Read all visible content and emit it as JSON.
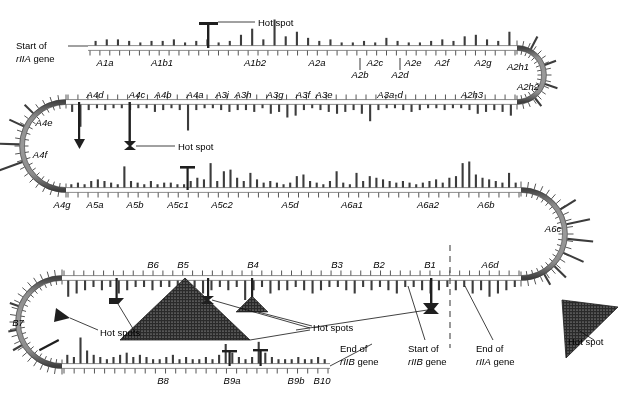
{
  "figure": {
    "type": "serpentine-mutation-map",
    "colors": {
      "line": "#7a7a7a",
      "line_edge": "#3a3a3a",
      "bar": "#3c3c3c",
      "tick": "#555555",
      "hotspot_fill": "#222222",
      "text": "#000000",
      "leader": "#000000",
      "dashed": "#555555"
    }
  },
  "annotations": {
    "start_rIIA": {
      "line1": "Start of",
      "line2_italic": "rIIA",
      "line2_rest": " gene"
    },
    "hot_spot_top": "Hot spot",
    "hot_spot_row2": "Hot spot",
    "hot_spots_b7": "Hot spots",
    "hot_spots_b5b4": "Hot spots",
    "hot_spots_b1": "Hot spots",
    "hot_spot_right": "Hot spot",
    "end_rIIB": {
      "line1": "End of",
      "line2_italic": "rIIB",
      "line2_rest": " gene"
    },
    "start_rIIB": {
      "line1": "Start of",
      "line2_italic": "rIIB",
      "line2_rest": " gene"
    },
    "end_rIIA": {
      "line1": "End of",
      "line2_italic": "rIIA",
      "line2_rest": " gene"
    }
  },
  "chart_data": {
    "type": "bar",
    "xlabel": "map position (segments)",
    "ylabel": "number of independent mutations",
    "rows": [
      {
        "row_id": "row1-top",
        "direction": "bars-up",
        "segment_labels": [
          "A1a",
          "A1b1",
          "A1b2",
          "A2a",
          "A2b",
          "A2c",
          "A2d",
          "A2e",
          "A2f",
          "A2g",
          "A2h1",
          "A2h2"
        ],
        "bar_values": [
          3,
          4,
          4,
          3,
          2,
          3,
          3,
          4,
          2,
          3,
          4,
          2,
          3,
          7,
          11,
          4,
          17,
          6,
          9,
          5,
          3,
          4,
          2,
          2,
          3,
          2,
          5,
          3,
          2,
          2,
          3,
          4,
          3,
          6,
          7,
          4,
          3,
          9
        ],
        "max_value": 17
      },
      {
        "row_id": "row2-top",
        "direction": "bars-down",
        "segment_labels": [
          "A4e",
          "A4d",
          "A4c",
          "A4b",
          "A4a",
          "A3i",
          "A3h",
          "A3g",
          "A3f",
          "A3e",
          "A3a-d",
          "A2h3",
          "A2h2"
        ],
        "bar_values": [
          4,
          12,
          3,
          2,
          3,
          2,
          2,
          3,
          2,
          2,
          4,
          3,
          2,
          3,
          14,
          3,
          2,
          2,
          3,
          4,
          3,
          3,
          4,
          2,
          5,
          4,
          7,
          6,
          3,
          2,
          3,
          4,
          5,
          4,
          3,
          5,
          9,
          3,
          2,
          2,
          3,
          4,
          3,
          2,
          2,
          3,
          2,
          2,
          3,
          5,
          4,
          3,
          4,
          6
        ],
        "max_value": 14
      },
      {
        "row_id": "row2-bottom",
        "direction": "bars-up",
        "segment_labels": [
          "A4g",
          "A5a",
          "A5b",
          "A5c1",
          "A5c2",
          "A5d",
          "A6a1",
          "A6a2",
          "A6b",
          "A6c"
        ],
        "bar_values": [
          2,
          3,
          2,
          4,
          5,
          4,
          3,
          2,
          13,
          4,
          3,
          2,
          4,
          2,
          3,
          3,
          2,
          2,
          4,
          6,
          5,
          15,
          4,
          10,
          11,
          6,
          4,
          9,
          5,
          3,
          4,
          3,
          2,
          3,
          7,
          8,
          4,
          3,
          2,
          4,
          10,
          3,
          2,
          9,
          4,
          7,
          6,
          5,
          4,
          3,
          4,
          3,
          2,
          3,
          4,
          5,
          3,
          6,
          7,
          15,
          16,
          8,
          6,
          5,
          4,
          3,
          9,
          3
        ],
        "max_value": 16
      },
      {
        "row_id": "row3-top",
        "direction": "bars-down",
        "segment_labels": [
          "B7",
          "B6",
          "B5",
          "B4",
          "B3",
          "B2",
          "B1",
          "A6d"
        ],
        "bar_values": [
          5,
          4,
          3,
          2,
          3,
          2,
          4,
          3,
          2,
          2,
          3,
          2,
          2,
          8,
          3,
          2,
          4,
          3,
          2,
          3,
          2,
          6,
          3,
          2,
          4,
          3,
          3,
          2,
          3,
          4,
          3,
          2,
          2,
          3,
          4,
          2,
          3,
          2,
          3,
          4,
          2,
          2,
          3,
          4,
          3,
          2,
          3,
          2,
          4,
          3,
          5,
          4,
          3,
          2
        ],
        "max_value": 8
      },
      {
        "row_id": "row3-bottom",
        "direction": "bars-up",
        "segment_labels": [
          "B8",
          "B9a",
          "B9b",
          "B10"
        ],
        "bar_values": [
          4,
          3,
          12,
          6,
          4,
          3,
          2,
          3,
          4,
          5,
          3,
          4,
          3,
          2,
          2,
          3,
          4,
          2,
          3,
          2,
          2,
          3,
          2,
          4,
          9,
          5,
          3,
          2,
          3,
          10,
          5,
          3,
          2,
          2,
          2,
          3,
          2,
          2,
          3,
          2
        ],
        "max_value": 12
      }
    ],
    "hotspots": [
      {
        "id": "hotspot-a1b2",
        "row": "row1-top",
        "label": "Hot spot",
        "relative_height": 17
      },
      {
        "id": "hotspot-a4c",
        "row": "row2-top",
        "label": "Hot spot",
        "relative_height": 14
      },
      {
        "id": "hotspot-b7",
        "row": "row3-left-turn",
        "label": "Hot spots",
        "relative_height": 10
      },
      {
        "id": "hotspot-b6",
        "row": "row3-top",
        "label": "Hot spots",
        "relative_height": 10
      },
      {
        "id": "hotspot-b5",
        "row": "row3-top",
        "label": "Hot spots",
        "relative_height": 60,
        "shape": "large-triangle"
      },
      {
        "id": "hotspot-b5b",
        "row": "row3-top",
        "label": "Hot spots",
        "relative_height": 12
      },
      {
        "id": "hotspot-b4",
        "row": "row3-top",
        "label": "Hot spots",
        "relative_height": 25
      },
      {
        "id": "hotspot-b1",
        "row": "row3-top",
        "label": "Hot spots",
        "relative_height": 22
      },
      {
        "id": "hotspot-a6c",
        "row": "row3-right-turn",
        "label": "Hot spot",
        "relative_height": 80,
        "shape": "large-triangle"
      }
    ]
  },
  "segments": {
    "row1_top": [
      {
        "label": "A1a",
        "x": 105
      },
      {
        "label": "A1b1",
        "x": 162
      },
      {
        "label": "A1b2",
        "x": 255
      },
      {
        "label": "A2a",
        "x": 317
      },
      {
        "label": "A2b",
        "x": 360
      },
      {
        "label": "A2c",
        "x": 375
      },
      {
        "label": "A2d",
        "x": 400
      },
      {
        "label": "A2e",
        "x": 413
      },
      {
        "label": "A2f",
        "x": 442
      },
      {
        "label": "A2g",
        "x": 483
      },
      {
        "label": "A2h1",
        "x": 518
      },
      {
        "label": "A2h2",
        "x": 528
      }
    ],
    "row2_top": [
      {
        "label": "A4e",
        "x": 44
      },
      {
        "label": "A4f",
        "x": 40
      },
      {
        "label": "A4d",
        "x": 95
      },
      {
        "label": "A4c",
        "x": 137
      },
      {
        "label": "A4b",
        "x": 163
      },
      {
        "label": "A4a",
        "x": 195
      },
      {
        "label": "A3i",
        "x": 222
      },
      {
        "label": "A3h",
        "x": 243
      },
      {
        "label": "A3g",
        "x": 275
      },
      {
        "label": "A3f",
        "x": 303
      },
      {
        "label": "A3e",
        "x": 324
      },
      {
        "label": "A3a-d",
        "x": 390
      },
      {
        "label": "A2h3",
        "x": 472
      }
    ],
    "row2_bottom": [
      {
        "label": "A4g",
        "x": 62
      },
      {
        "label": "A5a",
        "x": 95
      },
      {
        "label": "A5b",
        "x": 135
      },
      {
        "label": "A5c1",
        "x": 178
      },
      {
        "label": "A5c2",
        "x": 222
      },
      {
        "label": "A5d",
        "x": 290
      },
      {
        "label": "A6a1",
        "x": 352
      },
      {
        "label": "A6a2",
        "x": 428
      },
      {
        "label": "A6b",
        "x": 486
      },
      {
        "label": "A6c",
        "x": 553
      }
    ],
    "row3_top": [
      {
        "label": "B7",
        "x": 18
      },
      {
        "label": "B6",
        "x": 153
      },
      {
        "label": "B5",
        "x": 183
      },
      {
        "label": "B4",
        "x": 253
      },
      {
        "label": "B3",
        "x": 337
      },
      {
        "label": "B2",
        "x": 379
      },
      {
        "label": "B1",
        "x": 430
      },
      {
        "label": "A6d",
        "x": 490
      }
    ],
    "row3_bottom": [
      {
        "label": "B8",
        "x": 163
      },
      {
        "label": "B9a",
        "x": 232
      },
      {
        "label": "B9b",
        "x": 296
      },
      {
        "label": "B10",
        "x": 322
      }
    ]
  }
}
